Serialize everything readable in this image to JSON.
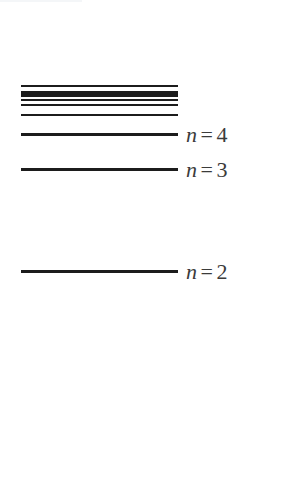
{
  "figure": {
    "kind": "energy-level-diagram",
    "width": 285,
    "height": 484,
    "background_color": "#ffffff",
    "line_color": "#1c1c1c",
    "label_color": "#3b3b3b",
    "line_left_x": 21,
    "line_right_x": 178,
    "label_left_x": 186
  },
  "chart_data": {
    "type": "line",
    "xlabel": "",
    "ylabel": "",
    "grid": false,
    "legend": "none",
    "levels": [
      {
        "id": "level-limit-1",
        "y": 85,
        "thickness": 2,
        "label": "",
        "labelled": false
      },
      {
        "id": "level-limit-2",
        "y": 91,
        "thickness": 6,
        "label": "",
        "labelled": false
      },
      {
        "id": "level-limit-3",
        "y": 99,
        "thickness": 2,
        "label": "",
        "labelled": false
      },
      {
        "id": "level-limit-4",
        "y": 104,
        "thickness": 2,
        "label": "",
        "labelled": false
      },
      {
        "id": "level-limit-5",
        "y": 114,
        "thickness": 2,
        "label": "",
        "labelled": false
      },
      {
        "id": "level-n4",
        "y": 133,
        "thickness": 3,
        "label": "n = 4",
        "labelled": true,
        "var": "n",
        "rel": "=",
        "num": "4"
      },
      {
        "id": "level-n3",
        "y": 168,
        "thickness": 3,
        "label": "n = 3",
        "labelled": true,
        "var": "n",
        "rel": "=",
        "num": "3"
      },
      {
        "id": "level-n2",
        "y": 270,
        "thickness": 3,
        "label": "n = 2",
        "labelled": true,
        "var": "n",
        "rel": "=",
        "num": "2"
      }
    ],
    "labels": [
      {
        "text": "n = 4",
        "y": 133
      },
      {
        "text": "n = 3",
        "y": 168
      },
      {
        "text": "n = 2",
        "y": 270
      }
    ]
  }
}
